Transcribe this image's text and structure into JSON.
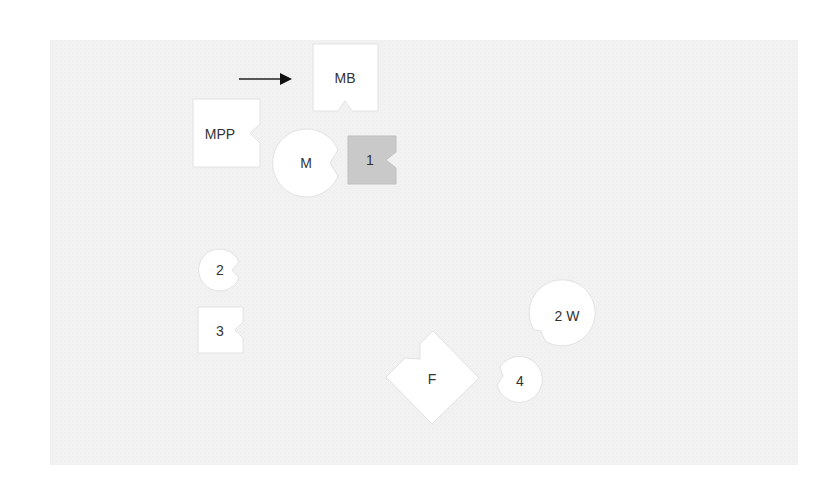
{
  "diagram": {
    "background_color": "#f1f1f1",
    "arrow": {
      "direction": "right",
      "color": "#222222"
    },
    "nodes": [
      {
        "id": "MB",
        "label": "MB",
        "shape": "square-notch-bottom",
        "fill": "#ffffff"
      },
      {
        "id": "MPP",
        "label": "MPP",
        "shape": "square-notch-right",
        "fill": "#ffffff"
      },
      {
        "id": "M",
        "label": "M",
        "shape": "circle-notch-right",
        "fill": "#ffffff"
      },
      {
        "id": "1",
        "label": "1",
        "shape": "square-notch-right",
        "fill": "#c9c9c9"
      },
      {
        "id": "2",
        "label": "2",
        "shape": "circle-notch-right",
        "fill": "#ffffff"
      },
      {
        "id": "3",
        "label": "3",
        "shape": "square-notch-right",
        "fill": "#ffffff"
      },
      {
        "id": "F",
        "label": "F",
        "shape": "diamond-notch-upper-left",
        "fill": "#ffffff"
      },
      {
        "id": "4",
        "label": "4",
        "shape": "circle-notch-left",
        "fill": "#ffffff"
      },
      {
        "id": "2W",
        "label": "2 W",
        "shape": "circle-notch-lower-left",
        "fill": "#ffffff"
      }
    ]
  }
}
